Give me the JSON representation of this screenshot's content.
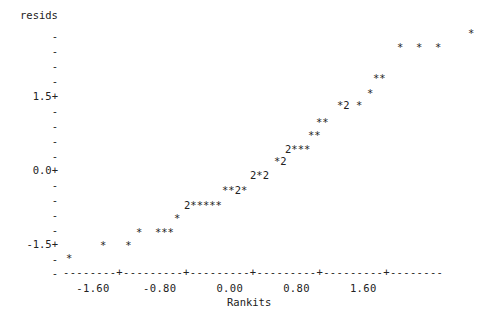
{
  "plot": {
    "y_axis_title": "resids",
    "x_axis_title": "Rankits",
    "x_axis_line": "--------+---------+---------+---------+---------+--------",
    "x_tick_labels_line": "  -1.60     -0.80      0.00      0.80      1.60",
    "y_tick_minor": "-",
    "y_tick_major_suffix": "+"
  },
  "chart_data": {
    "type": "scatter",
    "title": "",
    "xlabel": "Rankits",
    "ylabel": "resids",
    "xlim": [
      -2.0,
      2.0
    ],
    "ylim": [
      -2.0,
      2.35
    ],
    "xticks": [
      -1.6,
      -0.8,
      0.0,
      0.8,
      1.6
    ],
    "xtick_labels": [
      "-1.60",
      "-0.80",
      "0.00",
      "0.80",
      "1.60"
    ],
    "yticks": [
      1.5,
      0.0,
      -1.5
    ],
    "ytick_labels": [
      "1.5+",
      "0.0+",
      "-1.5+"
    ],
    "grid": false,
    "legend": null,
    "marker": "*",
    "overplot_marker": "2",
    "note": "Character-mode normal probability (rankit) plot of residuals; '2' denotes two coincident points.",
    "y_axis_rows": [
      {
        "label": "-",
        "value": 2.25,
        "top": 30
      },
      {
        "label": "-",
        "value": 2.0,
        "top": 45
      },
      {
        "label": "-",
        "value": 1.875,
        "top": 60
      },
      {
        "label": "-",
        "value": 1.75,
        "top": 75
      },
      {
        "label": "1.5+",
        "value": 1.5,
        "top": 90
      },
      {
        "label": "-",
        "value": 1.25,
        "top": 105
      },
      {
        "label": "-",
        "value": 1.0,
        "top": 120
      },
      {
        "label": "-",
        "value": 0.75,
        "top": 135
      },
      {
        "label": "-",
        "value": 0.5,
        "top": 150
      },
      {
        "label": "0.0+",
        "value": 0.0,
        "top": 164
      },
      {
        "label": "-",
        "value": -0.25,
        "top": 179
      },
      {
        "label": "-",
        "value": -0.5,
        "top": 194
      },
      {
        "label": "-",
        "value": -0.75,
        "top": 209
      },
      {
        "label": "-",
        "value": -1.0,
        "top": 224
      },
      {
        "label": "-1.5+",
        "value": -1.5,
        "top": 238
      },
      {
        "label": "-",
        "value": -1.75,
        "top": 253
      },
      {
        "label": "-",
        "value": -1.9,
        "top": 267
      }
    ],
    "data_rows": [
      {
        "text": "*",
        "left": 468,
        "top": 27
      },
      {
        "text": "*  *  *",
        "left": 397,
        "top": 41
      },
      {
        "text": "**",
        "left": 373,
        "top": 72
      },
      {
        "text": "*",
        "left": 367,
        "top": 87
      },
      {
        "text": "*2 *",
        "left": 337,
        "top": 99
      },
      {
        "text": "**",
        "left": 316,
        "top": 116
      },
      {
        "text": "**",
        "left": 308,
        "top": 129
      },
      {
        "text": "2***",
        "left": 285,
        "top": 143
      },
      {
        "text": "*2",
        "left": 274,
        "top": 155
      },
      {
        "text": "2*2",
        "left": 250,
        "top": 169
      },
      {
        "text": "**2*",
        "left": 222,
        "top": 184
      },
      {
        "text": "2*****",
        "left": 184,
        "top": 199
      },
      {
        "text": "*",
        "left": 174,
        "top": 212
      },
      {
        "text": "*  ***",
        "left": 136,
        "top": 226
      },
      {
        "text": "*   *",
        "left": 100,
        "top": 239
      },
      {
        "text": "*",
        "left": 66,
        "top": 252
      }
    ],
    "points": [
      {
        "x": -1.95,
        "y": -1.88,
        "n": 1
      },
      {
        "x": -1.45,
        "y": -1.62,
        "n": 1
      },
      {
        "x": -1.22,
        "y": -1.62,
        "n": 1
      },
      {
        "x": -0.99,
        "y": -1.43,
        "n": 1
      },
      {
        "x": -0.83,
        "y": -1.43,
        "n": 1
      },
      {
        "x": -0.76,
        "y": -1.43,
        "n": 1
      },
      {
        "x": -0.69,
        "y": -1.43,
        "n": 1
      },
      {
        "x": -0.56,
        "y": -1.27,
        "n": 1
      },
      {
        "x": -0.44,
        "y": -1.1,
        "n": 2
      },
      {
        "x": -0.37,
        "y": -1.1,
        "n": 1
      },
      {
        "x": -0.31,
        "y": -1.1,
        "n": 1
      },
      {
        "x": -0.25,
        "y": -1.1,
        "n": 1
      },
      {
        "x": -0.19,
        "y": -1.1,
        "n": 1
      },
      {
        "x": -0.13,
        "y": -1.1,
        "n": 1
      },
      {
        "x": 0.03,
        "y": -0.85,
        "n": 1
      },
      {
        "x": 0.09,
        "y": -0.85,
        "n": 1
      },
      {
        "x": 0.16,
        "y": -0.85,
        "n": 2
      },
      {
        "x": 0.22,
        "y": -0.85,
        "n": 1
      },
      {
        "x": 0.4,
        "y": -0.6,
        "n": 2
      },
      {
        "x": 0.47,
        "y": -0.6,
        "n": 1
      },
      {
        "x": 0.53,
        "y": -0.6,
        "n": 2
      },
      {
        "x": 0.68,
        "y": -0.35,
        "n": 1
      },
      {
        "x": 0.75,
        "y": -0.35,
        "n": 2
      },
      {
        "x": 0.87,
        "y": -0.1,
        "n": 2
      },
      {
        "x": 0.94,
        "y": -0.1,
        "n": 1
      },
      {
        "x": 1.0,
        "y": -0.1,
        "n": 1
      },
      {
        "x": 1.07,
        "y": -0.1,
        "n": 1
      },
      {
        "x": 1.32,
        "y": 0.3,
        "n": 1
      },
      {
        "x": 1.39,
        "y": 0.3,
        "n": 1
      },
      {
        "x": 1.41,
        "y": 0.55,
        "n": 1
      },
      {
        "x": 1.48,
        "y": 0.55,
        "n": 1
      },
      {
        "x": 1.72,
        "y": 0.85,
        "n": 1
      },
      {
        "x": 1.78,
        "y": 0.85,
        "n": 2
      },
      {
        "x": 1.86,
        "y": 0.85,
        "n": 1
      },
      {
        "x": 2.05,
        "y": 1.15,
        "n": 1
      },
      {
        "x": 2.19,
        "y": 1.4,
        "n": 1
      },
      {
        "x": 2.26,
        "y": 1.4,
        "n": 1
      },
      {
        "x": 2.8,
        "y": 2.05,
        "n": 1
      },
      {
        "x": 3.05,
        "y": 2.05,
        "n": 1
      },
      {
        "x": 3.3,
        "y": 2.05,
        "n": 1
      },
      {
        "x": 3.8,
        "y": 2.3,
        "n": 1
      }
    ]
  }
}
